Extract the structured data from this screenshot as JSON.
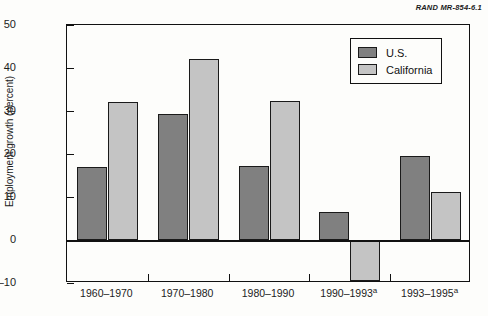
{
  "source_credit": "RAND MR-854-6.1",
  "chart_data": {
    "type": "bar",
    "title": "",
    "xlabel": "",
    "ylabel": "Employment growth (percent)",
    "categories": [
      "1960–1970",
      "1970–1980",
      "1980–1990",
      "1990–1993",
      "1993–1995"
    ],
    "category_footnotes": [
      "",
      "",
      "",
      "a",
      "a"
    ],
    "series": [
      {
        "name": "U.S.",
        "color": "#808080",
        "values": [
          17.0,
          29.3,
          17.3,
          6.5,
          19.6
        ]
      },
      {
        "name": "California",
        "color": "#c4c4c4",
        "values": [
          32.0,
          42.0,
          32.4,
          -9.5,
          11.1
        ]
      }
    ],
    "ylim": [
      -10,
      50
    ],
    "yticks": [
      50,
      40,
      30,
      20,
      10,
      0,
      -10
    ],
    "ytick_labels": [
      "50",
      "40",
      "30",
      "20",
      "10",
      "0",
      "–10"
    ],
    "grid": false,
    "legend_position": "top-right",
    "legend_entries": [
      "U.S.",
      "California"
    ]
  }
}
